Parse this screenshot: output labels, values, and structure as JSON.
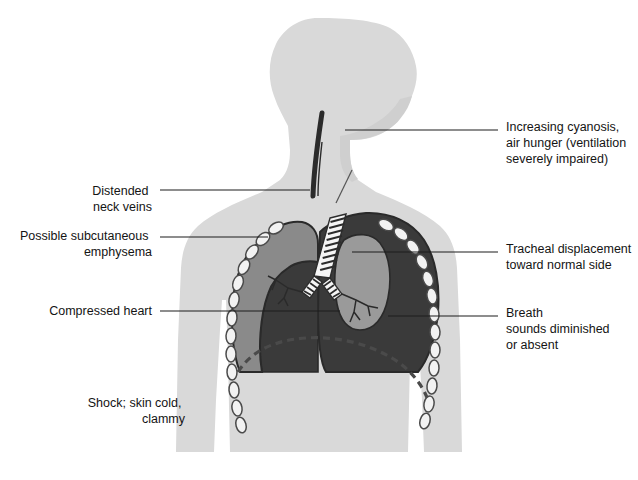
{
  "figure": {
    "background_color": "#ffffff"
  },
  "colors": {
    "body_silhouette": "#d9d9d9",
    "body_shadow": "#cfcfcf",
    "collapsed_lung": "#8a8a8a",
    "pneumothorax_field": "#3a3a3a",
    "compressed_lung": "#9a9a9a",
    "pleura_outline": "#2a2a2a",
    "rib_fill": "#f2f2f2",
    "rib_outline": "#4a4a4a",
    "trachea_fill": "#f5f5f5",
    "trachea_stripe": "#2c2c2c",
    "diaphragm_dashed": "#4a4a4a",
    "neck_vein": "#2b2b2b",
    "leader_line": "#1d1d1d",
    "label_text": "#141414"
  },
  "labels": {
    "right_side": [
      {
        "id": "cyanosis",
        "name": "label-increasing-cyanosis",
        "lines": [
          "Increasing cyanosis,",
          "air hunger (ventilation",
          "severely impaired)"
        ],
        "text_x": 506,
        "text_y": 131,
        "line_height": 16,
        "leader": {
          "x1": 345,
          "y1": 130,
          "x2": 498,
          "y2": 130
        }
      },
      {
        "id": "tracheal-displacement",
        "name": "label-tracheal-displacement",
        "lines": [
          "Tracheal displacement",
          "toward normal side"
        ],
        "text_x": 506,
        "text_y": 253,
        "line_height": 16,
        "leader": {
          "x1": 352,
          "y1": 252,
          "x2": 498,
          "y2": 252
        }
      },
      {
        "id": "breath-sounds",
        "name": "label-breath-sounds",
        "lines": [
          "Breath",
          "sounds diminished",
          "or absent"
        ],
        "text_x": 506,
        "text_y": 317,
        "line_height": 16,
        "leader": {
          "x1": 388,
          "y1": 316,
          "x2": 498,
          "y2": 316
        }
      }
    ],
    "left_side": [
      {
        "id": "distended-neck-veins",
        "name": "label-distended-neck-veins",
        "lines": [
          "Distended",
          "neck veins"
        ],
        "text_x": 152,
        "text_y": 195,
        "line_height": 16,
        "leader": {
          "x1": 160,
          "y1": 190,
          "x2": 310,
          "y2": 190
        }
      },
      {
        "id": "subcutaneous-emphysema",
        "name": "label-possible-subcutaneous-emphysema",
        "lines": [
          "Possible subcutaneous",
          "emphysema"
        ],
        "text_x": 152,
        "text_y": 240,
        "line_height": 16,
        "leader": {
          "x1": 160,
          "y1": 237,
          "x2": 268,
          "y2": 237
        }
      },
      {
        "id": "compressed-heart",
        "name": "label-compressed-heart",
        "lines": [
          "Compressed heart"
        ],
        "text_x": 152,
        "text_y": 315,
        "line_height": 16,
        "leader": {
          "x1": 160,
          "y1": 311,
          "x2": 340,
          "y2": 311
        }
      },
      {
        "id": "shock",
        "name": "label-shock-skin-cold-clammy",
        "lines": [
          "Shock; skin cold,",
          "clammy"
        ],
        "text_x": 185,
        "text_y": 407,
        "line_height": 16,
        "leader": null
      }
    ]
  },
  "anatomy": {
    "parts": [
      {
        "id": "body",
        "name": "body-silhouette"
      },
      {
        "id": "neck-vein",
        "name": "distended-neck-vein"
      },
      {
        "id": "emphysema-mark",
        "name": "subcutaneous-emphysema-mark"
      },
      {
        "id": "left-pleura",
        "name": "affected-hemithorax-pneumothorax"
      },
      {
        "id": "collapsed-lung",
        "name": "collapsed-lung"
      },
      {
        "id": "compressed-lung",
        "name": "compressed-lung"
      },
      {
        "id": "trachea",
        "name": "trachea-deviated"
      },
      {
        "id": "bronchi",
        "name": "bronchial-tree"
      },
      {
        "id": "ribcage",
        "name": "ribcage-chain"
      },
      {
        "id": "diaphragm",
        "name": "diaphragm-depressed-dashed"
      }
    ],
    "rib_count_left": 11,
    "rib_count_right": 11
  }
}
